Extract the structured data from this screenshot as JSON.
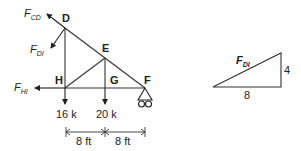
{
  "diagram": {
    "type": "truss-free-body-diagram",
    "joints": {
      "D": "D",
      "E": "E",
      "G": "G",
      "H": "H",
      "F": "F"
    },
    "forces": {
      "cd": {
        "main": "F",
        "sub": "CD"
      },
      "di": {
        "main": "F",
        "sub": "DI"
      },
      "hi": {
        "main": "F",
        "sub": "HI"
      }
    },
    "loads": {
      "h": "16 k",
      "g": "20 k"
    },
    "dimensions": {
      "left": "8 ft",
      "right": "8 ft"
    },
    "slope_triangle": {
      "hyp": {
        "main": "F",
        "sub": "DI"
      },
      "rise": "4",
      "run": "8"
    }
  },
  "colors": {
    "line": "#222222",
    "background": "#ffffff"
  }
}
